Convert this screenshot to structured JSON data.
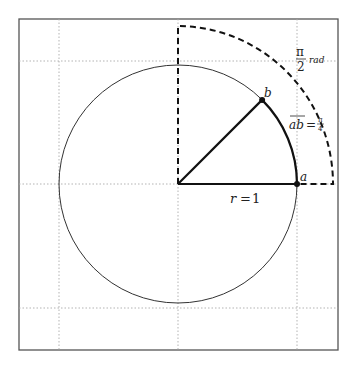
{
  "diagram": {
    "grid": {
      "x_ticks": [
        -1,
        0,
        1
      ],
      "y_ticks": [
        -1,
        0,
        1
      ],
      "style": "dotted"
    },
    "circle": {
      "radius_units": 1
    },
    "outer_arc": {
      "style": "dashed",
      "span_deg": 90
    },
    "points": [
      {
        "id": "a",
        "label": "a",
        "angle_deg": 0
      },
      {
        "id": "b",
        "label": "b",
        "angle_deg": 45
      }
    ],
    "labels": {
      "radius": "r = 1",
      "radius_var": "r",
      "radius_eq": "=",
      "radius_val": "1",
      "arc_name": "ab",
      "arc_eq": "=",
      "arc_num": "π",
      "arc_den": "4",
      "quarter_num": "π",
      "quarter_den": "2",
      "quarter_unit": "rad"
    },
    "colors": {
      "ink": "#222222",
      "grid": "#999999",
      "frame": "#555555"
    }
  }
}
